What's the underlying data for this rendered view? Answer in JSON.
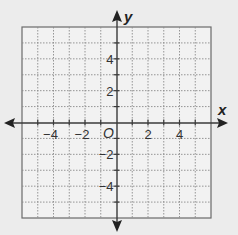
{
  "diagram": {
    "type": "coordinate-plane",
    "x_axis": {
      "label": "x",
      "min": -6,
      "max": 6,
      "tick_labels": [
        {
          "value": -4,
          "text": "−4"
        },
        {
          "value": -2,
          "text": "−2"
        },
        {
          "value": 2,
          "text": "2"
        },
        {
          "value": 4,
          "text": "4"
        }
      ]
    },
    "y_axis": {
      "label": "y",
      "min": -6,
      "max": 6,
      "tick_labels": [
        {
          "value": 4,
          "text": "4"
        },
        {
          "value": 2,
          "text": "2"
        },
        {
          "value": -2,
          "text": "−2"
        },
        {
          "value": -4,
          "text": "−4"
        }
      ]
    },
    "origin_label": "O",
    "grid": {
      "step": 1,
      "style": "dotted"
    },
    "colors": {
      "background": "#ececec",
      "grid_fill": "#f2f2f2",
      "grid_line": "#8a8a8a",
      "border": "#6a6a6a",
      "axis": "#3a3a3a",
      "text": "#333333"
    }
  }
}
